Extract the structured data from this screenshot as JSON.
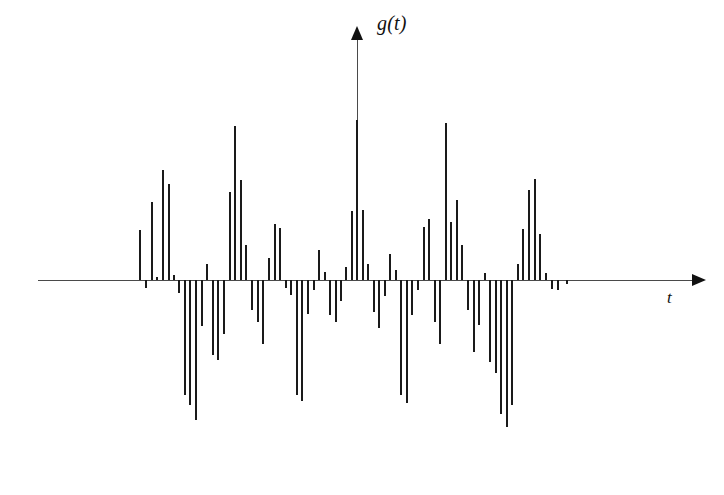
{
  "figure": {
    "title": "",
    "background_color": "#ffffff",
    "axis_color": "#4a4a4a",
    "stem_color": "#1a1a1a"
  },
  "labels": {
    "y_axis": "g(t)",
    "x_axis": "t"
  },
  "icons": {
    "x_arrow": "arrow-right-icon",
    "y_arrow": "arrow-up-icon"
  },
  "geometry": {
    "x_axis_y": 280,
    "x_axis_left": 38,
    "x_axis_right": 692,
    "y_axis_x": 357,
    "y_axis_top": 38,
    "y_axis_bottom": 280,
    "stem_spacing": 5.6,
    "first_stem_x": 140,
    "pixels_per_unit": 160
  },
  "chart_data": {
    "type": "line",
    "title": "",
    "subtitle": "",
    "xlabel": "t",
    "ylabel": "g(t)",
    "plot_style": "stem",
    "grid": false,
    "legend": null,
    "xticks": [],
    "yticks": [],
    "xlim": [
      -39,
      39
    ],
    "ylim": [
      -1.12,
      1.02
    ],
    "x": [
      -39,
      -38,
      -37,
      -36,
      -35,
      -34,
      -33,
      -32,
      -31,
      -30,
      -29,
      -28,
      -27,
      -26,
      -25,
      -24,
      -23,
      -22,
      -21,
      -20,
      -19,
      -18,
      -17,
      -16,
      -15,
      -14,
      -13,
      -12,
      -11,
      -10,
      -9,
      -8,
      -7,
      -6,
      -5,
      -4,
      -3,
      -2,
      -1,
      0,
      1,
      2,
      3,
      4,
      5,
      6,
      7,
      8,
      9,
      10,
      11,
      12,
      13,
      14,
      15,
      16,
      17,
      18,
      19,
      20,
      21,
      22,
      23,
      24,
      25,
      26,
      27,
      28,
      29,
      30,
      31,
      32,
      33,
      34,
      35,
      36,
      37,
      38,
      39
    ],
    "values": [
      0.02,
      -0.04,
      0.3,
      0.02,
      0.54,
      0.66,
      0.03,
      -0.05,
      -0.72,
      -0.78,
      -0.88,
      -0.29,
      0.1,
      -0.47,
      -0.5,
      -0.34,
      0.55,
      0.96,
      0.62,
      0.22,
      -0.19,
      -0.26,
      -0.4,
      0.14,
      0.35,
      0.33,
      -0.05,
      -0.09,
      -0.72,
      -0.76,
      -0.21,
      -0.06,
      0.19,
      0.05,
      -0.22,
      -0.26,
      -0.13,
      0.08,
      0.43,
      1.0,
      0.44,
      0.1,
      -0.2,
      -0.3,
      -0.1,
      0.16,
      0.06,
      -0.72,
      -0.77,
      -0.22,
      -0.06,
      0.33,
      0.38,
      -0.26,
      -0.4,
      0.98,
      0.36,
      0.5,
      0.22,
      -0.19,
      -0.45,
      -0.28,
      0.04,
      -0.51,
      -0.58,
      -0.84,
      -0.92,
      -0.78,
      0.1,
      0.32,
      0.56,
      0.63,
      0.29,
      0.04,
      -0.05,
      -0.06,
      0.01,
      0.0,
      0.0
    ]
  },
  "stems": [
    {
      "x": 140,
      "h": 50,
      "w": 2.2
    },
    {
      "x": 146,
      "h": -8,
      "w": 2.2
    },
    {
      "x": 152,
      "h": 78,
      "w": 2.2
    },
    {
      "x": 157,
      "h": 3,
      "w": 1.3
    },
    {
      "x": 163,
      "h": 110,
      "w": 2.4
    },
    {
      "x": 169,
      "h": 96,
      "w": 2.4
    },
    {
      "x": 174,
      "h": 5,
      "w": 1.3
    },
    {
      "x": 179,
      "h": -13,
      "w": 2.0
    },
    {
      "x": 185,
      "h": -115,
      "w": 2.4
    },
    {
      "x": 190,
      "h": -125,
      "w": 2.4
    },
    {
      "x": 196,
      "h": -140,
      "w": 2.4
    },
    {
      "x": 202,
      "h": -46,
      "w": 1.6
    },
    {
      "x": 207,
      "h": 16,
      "w": 2.0
    },
    {
      "x": 213,
      "h": -75,
      "w": 2.4
    },
    {
      "x": 218,
      "h": -80,
      "w": 2.0
    },
    {
      "x": 224,
      "h": -54,
      "w": 2.4
    },
    {
      "x": 230,
      "h": 88,
      "w": 1.6
    },
    {
      "x": 235,
      "h": 154,
      "w": 2.4
    },
    {
      "x": 241,
      "h": 100,
      "w": 2.4
    },
    {
      "x": 246,
      "h": 35,
      "w": 2.4
    },
    {
      "x": 252,
      "h": -30,
      "w": 1.8
    },
    {
      "x": 258,
      "h": -42,
      "w": 2.0
    },
    {
      "x": 263,
      "h": -64,
      "w": 2.4
    },
    {
      "x": 269,
      "h": 22,
      "w": 2.4
    },
    {
      "x": 275,
      "h": 56,
      "w": 1.6
    },
    {
      "x": 280,
      "h": 52,
      "w": 2.4
    },
    {
      "x": 286,
      "h": -8,
      "w": 1.3
    },
    {
      "x": 291,
      "h": -15,
      "w": 2.2
    },
    {
      "x": 297,
      "h": -115,
      "w": 2.4
    },
    {
      "x": 302,
      "h": -121,
      "w": 1.6
    },
    {
      "x": 308,
      "h": -34,
      "w": 2.2
    },
    {
      "x": 314,
      "h": -10,
      "w": 1.6
    },
    {
      "x": 319,
      "h": 30,
      "w": 2.4
    },
    {
      "x": 325,
      "h": 8,
      "w": 1.3
    },
    {
      "x": 330,
      "h": -35,
      "w": 2.2
    },
    {
      "x": 336,
      "h": -42,
      "w": 2.0
    },
    {
      "x": 341,
      "h": -21,
      "w": 1.6
    },
    {
      "x": 346,
      "h": 13,
      "w": 1.3
    },
    {
      "x": 352,
      "h": 69,
      "w": 2.6
    },
    {
      "x": 357,
      "h": 160,
      "w": 2.2
    },
    {
      "x": 363,
      "h": 70,
      "w": 2.6
    },
    {
      "x": 368,
      "h": 16,
      "w": 1.6
    },
    {
      "x": 374,
      "h": -32,
      "w": 2.2
    },
    {
      "x": 379,
      "h": -48,
      "w": 2.4
    },
    {
      "x": 385,
      "h": -16,
      "w": 1.6
    },
    {
      "x": 390,
      "h": 26,
      "w": 2.4
    },
    {
      "x": 396,
      "h": 10,
      "w": 1.3
    },
    {
      "x": 401,
      "h": -115,
      "w": 2.4
    },
    {
      "x": 407,
      "h": -123,
      "w": 1.6
    },
    {
      "x": 412,
      "h": -35,
      "w": 2.2
    },
    {
      "x": 418,
      "h": -10,
      "w": 1.6
    },
    {
      "x": 424,
      "h": 53,
      "w": 2.4
    },
    {
      "x": 429,
      "h": 61,
      "w": 1.6
    },
    {
      "x": 435,
      "h": -42,
      "w": 2.2
    },
    {
      "x": 440,
      "h": -64,
      "w": 2.4
    },
    {
      "x": 446,
      "h": 157,
      "w": 2.4
    },
    {
      "x": 451,
      "h": 58,
      "w": 2.4
    },
    {
      "x": 457,
      "h": 80,
      "w": 1.6
    },
    {
      "x": 462,
      "h": 35,
      "w": 2.4
    },
    {
      "x": 468,
      "h": -30,
      "w": 2.0
    },
    {
      "x": 474,
      "h": -72,
      "w": 2.4
    },
    {
      "x": 479,
      "h": -45,
      "w": 1.6
    },
    {
      "x": 485,
      "h": 7,
      "w": 2.2
    },
    {
      "x": 490,
      "h": -82,
      "w": 2.4
    },
    {
      "x": 496,
      "h": -93,
      "w": 2.4
    },
    {
      "x": 501,
      "h": -134,
      "w": 2.4
    },
    {
      "x": 507,
      "h": -147,
      "w": 2.4
    },
    {
      "x": 512,
      "h": -125,
      "w": 2.4
    },
    {
      "x": 518,
      "h": 16,
      "w": 2.0
    },
    {
      "x": 523,
      "h": 51,
      "w": 2.4
    },
    {
      "x": 529,
      "h": 90,
      "w": 2.4
    },
    {
      "x": 535,
      "h": 101,
      "w": 2.4
    },
    {
      "x": 540,
      "h": 46,
      "w": 2.4
    },
    {
      "x": 546,
      "h": 7,
      "w": 1.3
    },
    {
      "x": 552,
      "h": -9,
      "w": 2.0
    },
    {
      "x": 558,
      "h": -10,
      "w": 1.6
    },
    {
      "x": 567,
      "h": -4,
      "w": 2.6
    }
  ]
}
